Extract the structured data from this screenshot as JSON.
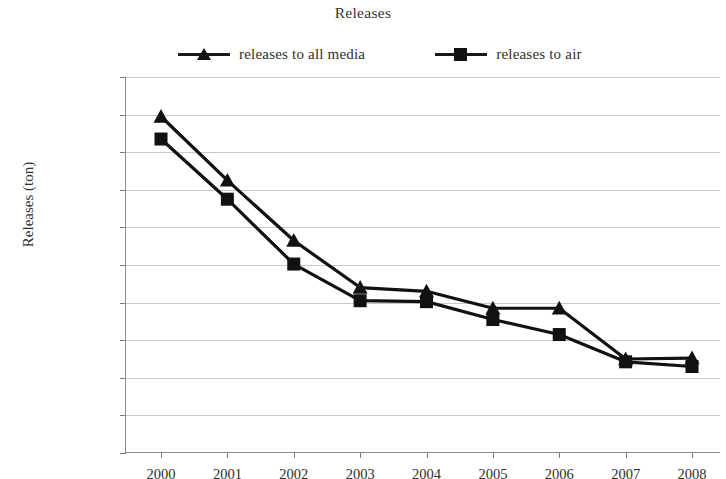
{
  "chart_data": {
    "type": "line",
    "title": "Releases",
    "xlabel": "",
    "ylabel": "Releases (ton)",
    "x": [
      2000,
      2001,
      2002,
      2003,
      2004,
      2005,
      2006,
      2007,
      2008
    ],
    "categories": [
      "2000",
      "2001",
      "2002",
      "2003",
      "2004",
      "2005",
      "2006",
      "2007",
      "2008"
    ],
    "series": [
      {
        "name": "releases to all media",
        "marker": "triangle",
        "color": "#111111",
        "values": [
          17900000,
          14500000,
          11300000,
          8800000,
          8600000,
          7700000,
          7700000,
          5000000,
          5050000
        ]
      },
      {
        "name": "releases to air",
        "marker": "square",
        "color": "#111111",
        "values": [
          16700000,
          13500000,
          10050000,
          8100000,
          8050000,
          7100000,
          6300000,
          4850000,
          4600000
        ]
      }
    ],
    "ylim": [
      0,
      20000000
    ],
    "ytick_values": [
      0,
      2000000,
      4000000,
      6000000,
      8000000,
      10000000,
      12000000,
      14000000,
      16000000,
      18000000,
      20000000
    ],
    "ytick_labels": [
      "0",
      "2000000",
      "4000000",
      "6000000",
      "8000000",
      "10000000",
      "12000000",
      "14000000",
      "16000000",
      "18000000",
      "20000000"
    ],
    "grid": true,
    "grid_axis": "y",
    "legend_position": "top",
    "gridline_color": "#c9c9c9",
    "axis_color": "#8e8e8e",
    "background": "#ffffff"
  }
}
